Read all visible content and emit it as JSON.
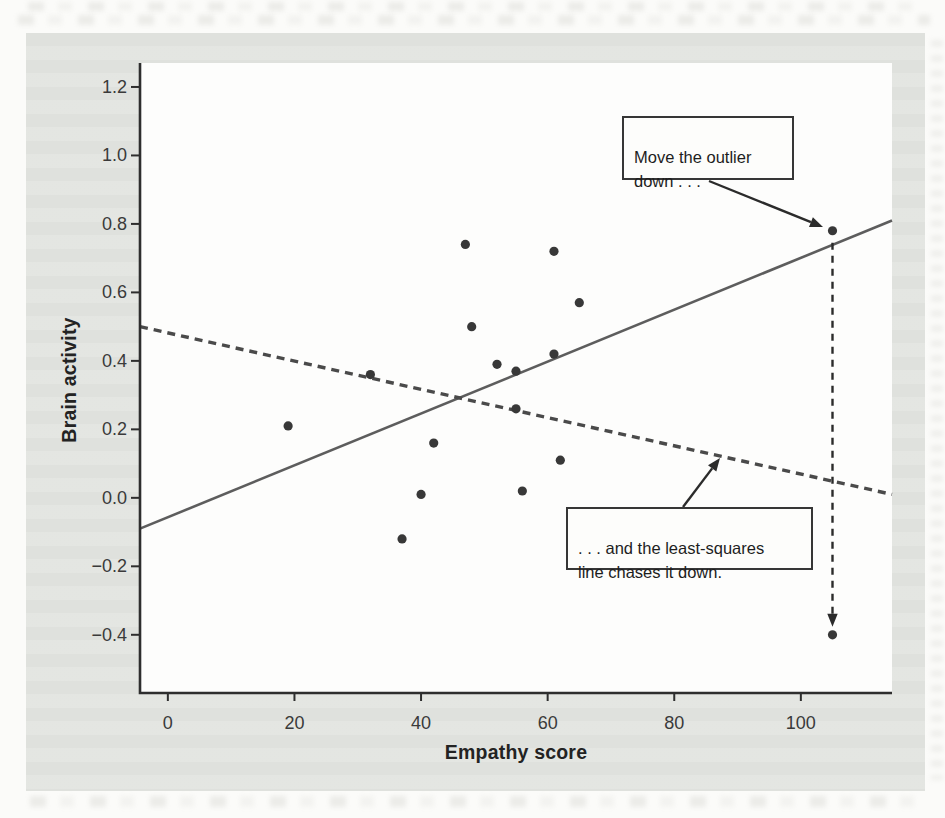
{
  "figure": {
    "context": "textbook scatterplot figure on a printed book page"
  },
  "colors": {
    "page_bg": "#fbfbf9",
    "panel_bg": "#e3e5e1",
    "plot_bg": "#fdfdfc",
    "axis": "#2e2e2e",
    "tick_text": "#3a3a3a",
    "point": "#383838",
    "solid_line": "#5d5d5d",
    "dashed_line": "#4a4a4a",
    "arrow": "#2b2b2b",
    "callout_border": "#363636"
  },
  "chart_data": {
    "type": "scatter",
    "xlabel": "Empathy score",
    "ylabel": "Brain activity",
    "xlim": [
      -4.4,
      114.4
    ],
    "ylim": [
      -0.57,
      1.27
    ],
    "grid": false,
    "x_ticks": [
      0,
      20,
      40,
      60,
      80,
      100
    ],
    "x_tick_labels": [
      "0",
      "20",
      "40",
      "60",
      "80",
      "100"
    ],
    "y_ticks": [
      1.2,
      1.0,
      0.8,
      0.6,
      0.4,
      0.2,
      0.0,
      -0.2,
      -0.4
    ],
    "y_tick_labels": [
      "1.2",
      "1.0",
      "0.8",
      "0.6",
      "0.4",
      "0.2",
      "0.0",
      "−0.2",
      "−0.4"
    ],
    "points": [
      [
        19,
        0.21
      ],
      [
        32,
        0.36
      ],
      [
        37,
        -0.12
      ],
      [
        40,
        0.01
      ],
      [
        42,
        0.16
      ],
      [
        47,
        0.74
      ],
      [
        48,
        0.5
      ],
      [
        52,
        0.39
      ],
      [
        55,
        0.37
      ],
      [
        55,
        0.26
      ],
      [
        56,
        0.02
      ],
      [
        61,
        0.72
      ],
      [
        61,
        0.42
      ],
      [
        62,
        0.11
      ],
      [
        65,
        0.57
      ]
    ],
    "outlier": {
      "x": 105,
      "y": 0.78
    },
    "moved_outlier": {
      "x": 105,
      "y": -0.4
    },
    "lines": [
      {
        "id": "least-squares-original",
        "style": "solid",
        "from": [
          -4.4,
          -0.09
        ],
        "to": [
          114.4,
          0.81
        ]
      },
      {
        "id": "least-squares-chased",
        "style": "dashed",
        "from": [
          -4.4,
          0.5
        ],
        "to": [
          114.4,
          0.01
        ]
      }
    ],
    "annotations": [
      {
        "id": "move-outlier",
        "text": "Move the outlier\ndown . . ."
      },
      {
        "id": "line-chases",
        "text": ". . . and the least-squares\nline chases it down."
      }
    ]
  }
}
